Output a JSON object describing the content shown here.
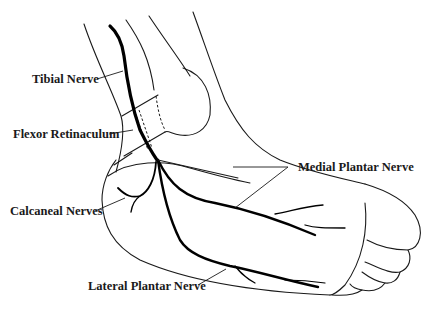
{
  "diagram": {
    "labels": {
      "tibial_nerve": "Tibial Nerve",
      "flexor_retinaculum": "Flexor Retinaculum",
      "calcaneal_nerves": "Calcaneal Nerves",
      "medial_plantar_nerve": "Medial Plantar Nerve",
      "lateral_plantar_nerve": "Lateral Plantar Nerve"
    },
    "colors": {
      "line": "#1a1a1a",
      "nerve": "#000000",
      "background": "#ffffff"
    }
  }
}
